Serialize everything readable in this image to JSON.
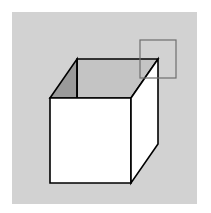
{
  "figure": {
    "background": "#ffffff",
    "panel": {
      "x": 12,
      "y": 12,
      "w": 185,
      "h": 192,
      "fill": "#d2d2d2"
    },
    "cube": {
      "stroke": "#000000",
      "front_face": {
        "points": "50,98 131,98 131,183 50,183",
        "fill": "#ffffff"
      },
      "right_face": {
        "points": "131,98 158,59 158,144 131,183",
        "fill": "#ffffff"
      },
      "left_inner_face": {
        "points": "50,98 77,59 77,98",
        "fill": "#9a9a9a"
      },
      "back_inner_face": {
        "points": "77,59 158,59 131,98 77,98",
        "fill": "#c4c4c4"
      }
    },
    "highlight_square": {
      "x": 140,
      "y": 40,
      "w": 36,
      "h": 38,
      "stroke": "#6e6e6e"
    }
  }
}
